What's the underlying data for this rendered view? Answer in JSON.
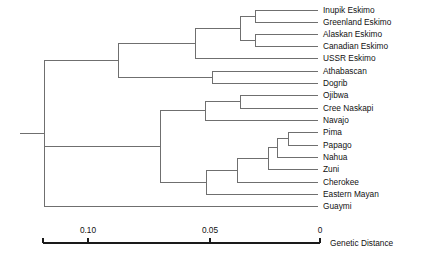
{
  "figure": {
    "background_color": "#ffffff",
    "branch_color": "#6f6f6f",
    "axis_color": "#1a1a1a",
    "text_color": "#111111"
  },
  "chart_data": {
    "type": "tree",
    "title": "",
    "xlabel": "Genetic Distance",
    "ylabel": "",
    "grid": false,
    "legend": "none",
    "axis": {
      "caption": "Genetic Distance",
      "direction": "right-to-left",
      "range_px": [
        43,
        320
      ],
      "domain": [
        0.1255,
        0.0
      ],
      "ticks": [
        {
          "label": "0.10",
          "value": 0.1,
          "x_px": 88
        },
        {
          "label": "0.05",
          "value": 0.05,
          "x_px": 210
        },
        {
          "label": "0",
          "value": 0.0,
          "x_px": 320
        }
      ],
      "tick_y_px": 243,
      "tick_size_px": 5,
      "label_y_px": 233,
      "caption_x_px": 330,
      "caption_y_px": 246
    },
    "leaves": [
      {
        "name": "Inupik  Eskimo",
        "y_px": 10,
        "branch_start_px": 255
      },
      {
        "name": "Greenland  Eskimo",
        "y_px": 22,
        "branch_start_px": 255
      },
      {
        "name": "Alaskan  Eskimo",
        "y_px": 34,
        "branch_start_px": 255
      },
      {
        "name": "Canadian  Eskimo",
        "y_px": 46,
        "branch_start_px": 255
      },
      {
        "name": "USSR Eskimo",
        "y_px": 58,
        "branch_start_px": 195
      },
      {
        "name": "Athabascan",
        "y_px": 71,
        "branch_start_px": 212
      },
      {
        "name": "Dogrib",
        "y_px": 83,
        "branch_start_px": 212
      },
      {
        "name": "Ojibwa",
        "y_px": 95,
        "branch_start_px": 240
      },
      {
        "name": "Cree Naskapi",
        "y_px": 108,
        "branch_start_px": 240
      },
      {
        "name": "Navajo",
        "y_px": 120,
        "branch_start_px": 205
      },
      {
        "name": "Pima",
        "y_px": 132,
        "branch_start_px": 288
      },
      {
        "name": "Papago",
        "y_px": 145,
        "branch_start_px": 288
      },
      {
        "name": "Nahua",
        "y_px": 157,
        "branch_start_px": 277
      },
      {
        "name": "Zuni",
        "y_px": 169,
        "branch_start_px": 268
      },
      {
        "name": "Cherokee",
        "y_px": 182,
        "branch_start_px": 237
      },
      {
        "name": "Eastern  Mayan",
        "y_px": 194,
        "branch_start_px": 206
      },
      {
        "name": "Guaymi",
        "y_px": 206,
        "branch_start_px": 44
      }
    ],
    "leaf_tip_x_px": 318,
    "label_x_px": 323,
    "nodes": [
      {
        "id": "n_inupik_greenland",
        "x_px": 255,
        "y_top_px": 10,
        "y_bot_px": 22,
        "stem_to_px": 240
      },
      {
        "id": "n_alaskan_canadian",
        "x_px": 255,
        "y_top_px": 34,
        "y_bot_px": 46,
        "stem_to_px": 240
      },
      {
        "id": "n_four_eskimo",
        "x_px": 240,
        "y_top_px": 16,
        "y_bot_px": 40,
        "stem_to_px": 195
      },
      {
        "id": "n_all_eskimo",
        "x_px": 195,
        "y_top_px": 28,
        "y_bot_px": 58,
        "stem_to_px": 118
      },
      {
        "id": "n_atha_dogrib",
        "x_px": 212,
        "y_top_px": 71,
        "y_bot_px": 83,
        "stem_to_px": 118
      },
      {
        "id": "n_northern",
        "x_px": 118,
        "y_top_px": 43,
        "y_bot_px": 77,
        "stem_to_px": 44
      },
      {
        "id": "n_ojibwa_cree",
        "x_px": 240,
        "y_top_px": 95,
        "y_bot_px": 108,
        "stem_to_px": 205
      },
      {
        "id": "n_navajo_group",
        "x_px": 205,
        "y_top_px": 101,
        "y_bot_px": 120,
        "stem_to_px": 160
      },
      {
        "id": "n_pima_papago",
        "x_px": 288,
        "y_top_px": 132,
        "y_bot_px": 145,
        "stem_to_px": 277
      },
      {
        "id": "n_nahua_group",
        "x_px": 277,
        "y_top_px": 138,
        "y_bot_px": 157,
        "stem_to_px": 268
      },
      {
        "id": "n_zuni_group",
        "x_px": 268,
        "y_top_px": 147,
        "y_bot_px": 169,
        "stem_to_px": 237
      },
      {
        "id": "n_cherokee_group",
        "x_px": 237,
        "y_top_px": 158,
        "y_bot_px": 182,
        "stem_to_px": 206
      },
      {
        "id": "n_mayan_group",
        "x_px": 206,
        "y_top_px": 170,
        "y_bot_px": 194,
        "stem_to_px": 160
      },
      {
        "id": "n_southern",
        "x_px": 160,
        "y_top_px": 110,
        "y_bot_px": 182,
        "stem_to_px": 44
      },
      {
        "id": "n_root",
        "x_px": 44,
        "y_top_px": 60,
        "y_bot_px": 206,
        "stem_to_px": 20
      }
    ],
    "root_stem": {
      "x_from_px": 20,
      "x_to_px": 44,
      "y_px": 133
    }
  }
}
